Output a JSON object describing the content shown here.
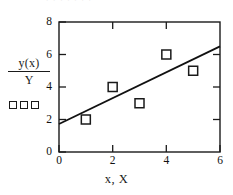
{
  "figure": {
    "top_fragment_text": "· · · ·      · · ·",
    "background_color": "#ffffff",
    "ink_color": "#1a1a1a"
  },
  "chart_data": {
    "type": "scatter",
    "title": "",
    "xlabel": "x, X",
    "ylabel_numerator": "y(x)",
    "ylabel_denominator": "Y",
    "xlim": [
      0,
      6
    ],
    "ylim": [
      0,
      8
    ],
    "xticks": [
      0,
      2,
      4,
      6
    ],
    "xticklabels": [
      "0",
      "2",
      "4",
      "6"
    ],
    "yticks": [
      0,
      2,
      4,
      6,
      8
    ],
    "yticklabels": [
      "0",
      "2",
      "4",
      "6",
      "8"
    ],
    "grid": false,
    "frame": "box",
    "tick_direction": "in",
    "legend": {
      "position": "left-of-axis",
      "marker": "open-square",
      "marker_count": 3
    },
    "series": [
      {
        "name": "Y",
        "type": "scatter",
        "marker": "open-square",
        "marker_color": "#1a1a1a",
        "points": [
          {
            "x": 1,
            "y": 2
          },
          {
            "x": 2,
            "y": 4
          },
          {
            "x": 3,
            "y": 3
          },
          {
            "x": 4,
            "y": 6
          },
          {
            "x": 5,
            "y": 5
          }
        ]
      },
      {
        "name": "y(x)",
        "type": "line",
        "line_color": "#111111",
        "line_width": 1.8,
        "endpoints": [
          {
            "x": 0,
            "y": 1.72
          },
          {
            "x": 6,
            "y": 6.5
          }
        ]
      }
    ]
  }
}
